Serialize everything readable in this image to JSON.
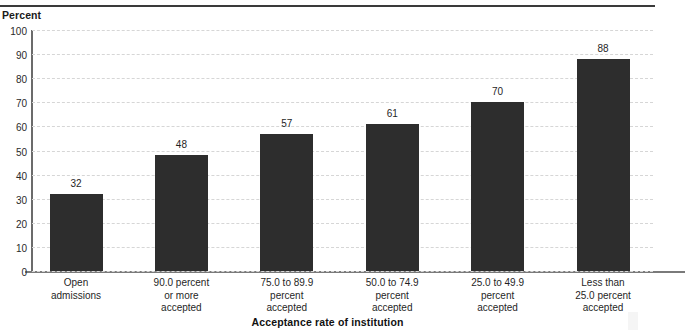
{
  "figure": {
    "y_axis_caption": "Percent",
    "x_axis_title": "Acceptance rate of institution"
  },
  "chart_data": {
    "type": "bar",
    "title": "",
    "xlabel": "Acceptance rate of institution",
    "ylabel": "Percent",
    "ylim": [
      0,
      100
    ],
    "yticks": [
      0,
      10,
      20,
      30,
      40,
      50,
      60,
      70,
      80,
      90,
      100
    ],
    "grid": true,
    "legend": false,
    "bar_color": "#2d2d2d",
    "categories": [
      "Open admissions",
      "90.0 percent or more accepted",
      "75.0 to 89.9 percent accepted",
      "50.0 to 74.9 percent accepted",
      "25.0 to 49.9 percent accepted",
      "Less than 25.0 percent accepted"
    ],
    "category_lines": [
      [
        "Open",
        "admissions"
      ],
      [
        "90.0 percent",
        "or more",
        "accepted"
      ],
      [
        "75.0 to 89.9",
        "percent",
        "accepted"
      ],
      [
        "50.0 to 74.9",
        "percent",
        "accepted"
      ],
      [
        "25.0 to 49.9",
        "percent",
        "accepted"
      ],
      [
        "Less than",
        "25.0 percent",
        "accepted"
      ]
    ],
    "values": [
      32,
      48,
      57,
      61,
      70,
      88
    ],
    "value_labels": [
      "32",
      "48",
      "57",
      "61",
      "70",
      "88"
    ]
  }
}
